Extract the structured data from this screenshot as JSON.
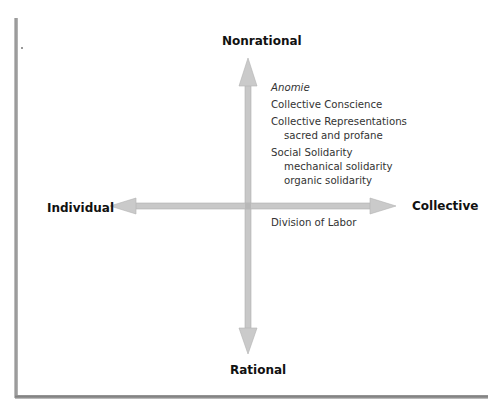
{
  "diagram": {
    "type": "quadrant-axes",
    "axes": {
      "vertical": {
        "top_label": "Nonrational",
        "bottom_label": "Rational"
      },
      "horizontal": {
        "left_label": "Individual",
        "right_label": "Collective"
      }
    },
    "quadrant_collective_nonrational": {
      "items": [
        {
          "title": "Anomie",
          "italic": true,
          "subitems": []
        },
        {
          "title": "Collective Conscience",
          "italic": false,
          "subitems": []
        },
        {
          "title": "Collective Representations",
          "italic": false,
          "subitems": [
            "sacred and profane"
          ]
        },
        {
          "title": "Social Solidarity",
          "italic": false,
          "subitems": [
            "mechanical solidarity",
            "organic solidarity"
          ]
        }
      ]
    },
    "quadrant_collective_rational": {
      "items": [
        {
          "title": "Division of Labor",
          "italic": false,
          "subitems": []
        }
      ]
    },
    "colors": {
      "arrow_fill": "#c8c8c8",
      "arrow_edge": "#a9a9a9",
      "label_text": "#111111",
      "concept_text": "#333333",
      "frame_shadow": "#8a8a8a"
    }
  }
}
